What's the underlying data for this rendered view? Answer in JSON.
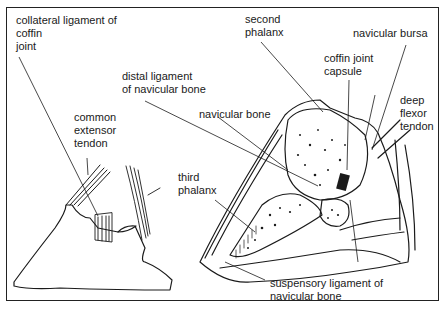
{
  "diagram": {
    "type": "anatomical-illustration",
    "colors": {
      "ink": "#1a1a1a",
      "background": "#ffffff"
    },
    "labels": {
      "collateral_ligament": "collateral ligament of\ncoffin\njoint",
      "common_extensor": "common\nextensor\ntendon",
      "distal_ligament": "distal ligament\nof navicular bone",
      "navicular_bone": "navicular bone",
      "third_phalanx": "third\nphalanx",
      "second_phalanx": "second\nphalanx",
      "navicular_bursa": "navicular bursa",
      "coffin_joint_capsule": "coffin joint\ncapsule",
      "deep_flexor_tendon": "deep\nflexor\ntendon",
      "suspensory_ligament": "suspensory ligament of\nnavicular bone"
    }
  }
}
